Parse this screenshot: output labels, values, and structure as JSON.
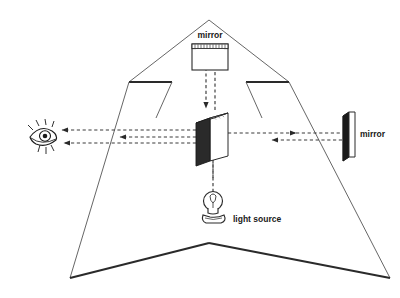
{
  "diagram": {
    "background": "#ffffff",
    "ink": "#1a1a1a",
    "labels": {
      "top_mirror": "mirror",
      "right_mirror": "mirror",
      "light_source": "light source"
    },
    "components": [
      {
        "name": "top-mirror",
        "kind": "mirror",
        "position": "top-center"
      },
      {
        "name": "right-mirror",
        "kind": "mirror",
        "position": "right"
      },
      {
        "name": "beam-splitter",
        "kind": "beam-splitter",
        "position": "center"
      },
      {
        "name": "light-source",
        "kind": "light-bulb",
        "position": "bottom-center"
      },
      {
        "name": "observer-eye",
        "kind": "eye",
        "position": "left"
      }
    ],
    "rays": [
      {
        "name": "source-to-splitter",
        "direction": "up",
        "style": "dashed"
      },
      {
        "name": "splitter-to-top-mirror",
        "direction": "up",
        "style": "dashed"
      },
      {
        "name": "top-mirror-to-splitter",
        "direction": "down",
        "style": "dashed"
      },
      {
        "name": "splitter-to-right-mirror",
        "direction": "right",
        "style": "dashed"
      },
      {
        "name": "right-mirror-to-splitter",
        "direction": "left",
        "style": "dashed"
      },
      {
        "name": "splitter-to-eye-upper",
        "direction": "left",
        "style": "dashed"
      },
      {
        "name": "splitter-to-eye-lower",
        "direction": "left",
        "style": "dashed"
      }
    ],
    "outline": {
      "name": "arrow-enclosure",
      "shape": "large-3d-arrow-outline"
    }
  }
}
